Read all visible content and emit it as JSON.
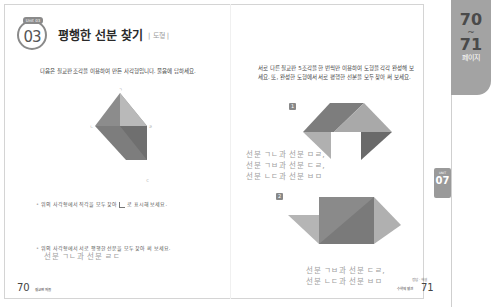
{
  "header": {
    "unit_label": "Unit 03",
    "unit_number": "03",
    "title": "평행한 선분 찾기",
    "category": "| 도형 |"
  },
  "left_page": {
    "instruction": "다음은 칠교판 조각을 이용하여 만든 사각형입니다. 물음에 답하세요.",
    "figure_points": [
      "ㄱ",
      "ㄴ",
      "ㄷ",
      "ㄹ"
    ],
    "question1": {
      "mark": "•",
      "text_before": "위의 사각형에서 직각을 모두 찾아",
      "text_after": "로 표시해 보세요."
    },
    "question2": {
      "mark": "•",
      "text": "위의 사각형에서 서로 평행한 선분을 모두 찾아 써 보세요.",
      "answer": "선분 ㄱㄴ과 선분 ㄹㄷ"
    },
    "page_number": "70",
    "page_footer": "칠교판 퍼즐"
  },
  "right_page": {
    "instruction_line1": "서로 다른 칠교판 5조각을 한 번씩만 이용하여 도형을 각각 완성해 보",
    "instruction_line2": "세요. 또, 완성한 도형에서 서로 평행한 선분을 모두 찾아 써 보세요.",
    "figure1": {
      "number": "1",
      "points": [
        "ㄱ",
        "ㄴ",
        "ㄷ",
        "ㄹ",
        "ㅁ",
        "ㅂ"
      ],
      "answer_lines": [
        "선분 ㄱㄴ과 선분 ㅁㄹ,",
        "선분 ㄱㅂ과 선분 ㄷㄹ,",
        "선분 ㄴㄷ과 선분 ㅂㅁ"
      ]
    },
    "figure2": {
      "number": "2",
      "points": [
        "ㄱ",
        "ㄴ",
        "ㄷ",
        "ㄹ",
        "ㅁ",
        "ㅂ"
      ],
      "answer_lines": [
        "선분 ㄱㅂ과 선분 ㄷㄹ,",
        "선분 ㄴㄷ과 선분 ㅂㅁ"
      ]
    },
    "footer_small": "정답 · 해설",
    "footer_label": "수학의 발견",
    "page_number": "71"
  },
  "side_tab": {
    "page_start": "70",
    "tilde": "~",
    "page_end": "71",
    "label": "페이지"
  },
  "unit_tab": {
    "small": "UNIT",
    "number": "07"
  },
  "colors": {
    "dark_gray": "#7a7a7a",
    "mid_gray": "#9a9a9a",
    "light_gray": "#bdbdbd",
    "tab_gray": "#a3a3a3"
  }
}
